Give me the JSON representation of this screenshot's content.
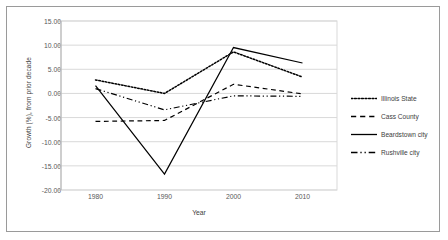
{
  "chart_data": {
    "type": "line",
    "title": "",
    "xlabel": "Year",
    "ylabel": "Growth (%), from prior decade",
    "categories": [
      "1980",
      "1990",
      "2000",
      "2010"
    ],
    "x": [
      1980,
      1990,
      2000,
      2010
    ],
    "xlim": [
      1975,
      2015
    ],
    "ylim": [
      -20.0,
      15.0
    ],
    "ytick_labels": [
      "15.00",
      "10.00",
      "5.00",
      "0.00",
      "-5.00",
      "-10.00",
      "-15.00",
      "-20.00"
    ],
    "ytick_values": [
      15.0,
      10.0,
      5.0,
      0.0,
      -5.0,
      -10.0,
      -15.0,
      -20.0
    ],
    "grid": "horizontal",
    "legend_position": "right",
    "series": [
      {
        "name": "Illinois State",
        "style": "dotted",
        "color": "#000000",
        "values": [
          2.8,
          0.0,
          8.6,
          3.4
        ]
      },
      {
        "name": "Cass County",
        "style": "dashed",
        "color": "#000000",
        "values": [
          -5.8,
          -5.6,
          1.9,
          -0.1
        ]
      },
      {
        "name": "Beardstown city",
        "style": "solid",
        "color": "#000000",
        "values": [
          1.6,
          -16.7,
          9.5,
          6.3
        ]
      },
      {
        "name": "Rushville city",
        "style": "dashdot",
        "color": "#000000",
        "values": [
          1.0,
          -3.4,
          -0.5,
          -0.6
        ]
      }
    ]
  }
}
